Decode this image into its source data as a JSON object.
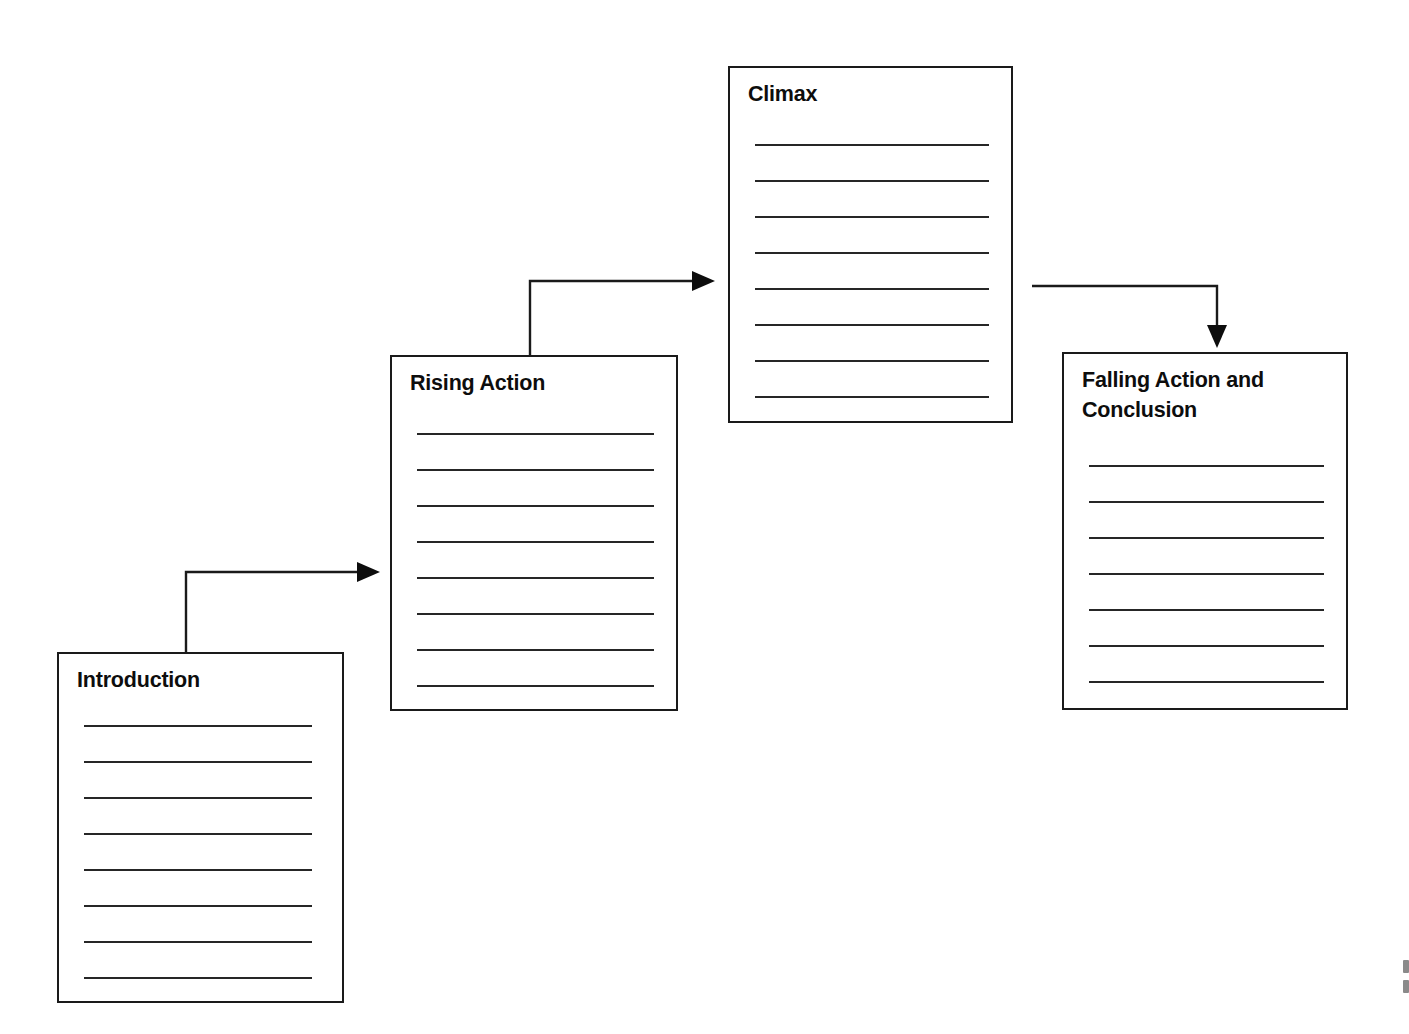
{
  "document": {
    "kind": "story-map-graphic-organizer",
    "title": "Story Map",
    "background_color": "#ffffff",
    "ink_color": "#1a1a1a",
    "width": 1409,
    "height": 1034
  },
  "boxes": [
    {
      "id": "introduction",
      "title": "Introduction",
      "title_lines": [
        "Introduction"
      ],
      "x": 57,
      "y": 652,
      "width": 287,
      "height": 351,
      "writing_lines": 8,
      "line_inset_left": 25,
      "line_inset_right": 30,
      "first_line_offset": 71,
      "line_spacing": 36
    },
    {
      "id": "rising-action",
      "title": "Rising Action",
      "title_lines": [
        "Rising Action"
      ],
      "x": 390,
      "y": 355,
      "width": 288,
      "height": 356,
      "writing_lines": 8,
      "line_inset_left": 25,
      "line_inset_right": 22,
      "first_line_offset": 76,
      "line_spacing": 36
    },
    {
      "id": "climax",
      "title": "Climax",
      "title_lines": [
        "Climax"
      ],
      "x": 728,
      "y": 66,
      "width": 285,
      "height": 357,
      "writing_lines": 8,
      "line_inset_left": 25,
      "line_inset_right": 22,
      "first_line_offset": 76,
      "line_spacing": 36
    },
    {
      "id": "falling-action-and-conclusion",
      "title": "Falling Action and Conclusion",
      "title_lines": [
        "Falling Action and",
        "Conclusion"
      ],
      "x": 1062,
      "y": 352,
      "width": 286,
      "height": 358,
      "writing_lines": 7,
      "line_inset_left": 25,
      "line_inset_right": 22,
      "first_line_offset": 111,
      "line_spacing": 36
    }
  ],
  "connectors": [
    {
      "id": "introduction-to-rising-action",
      "from": "introduction",
      "to": "rising-action",
      "label": "",
      "direction": "up-then-right",
      "arrowhead": "right",
      "path": "M 186 652 L 186 572 L 357 572",
      "head_points": "357,562 380,572 357,582"
    },
    {
      "id": "rising-action-to-climax",
      "from": "rising-action",
      "to": "climax",
      "label": "",
      "direction": "up-then-right",
      "arrowhead": "right",
      "path": "M 530 355 L 530 281 L 692 281",
      "head_points": "692,271 715,281 692,291"
    },
    {
      "id": "climax-to-falling-action",
      "from": "climax",
      "to": "falling-action-and-conclusion",
      "label": "",
      "direction": "right-then-down",
      "arrowhead": "down",
      "path": "M 1032 286 L 1217 286 L 1217 325",
      "head_points": "1207,325 1227,325 1217,348"
    }
  ],
  "edge_artifact": {
    "present": true,
    "description": "faint cropped page-edge mark at bottom right",
    "marks": 2
  }
}
